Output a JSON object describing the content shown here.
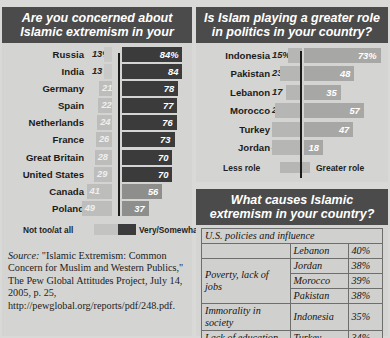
{
  "panel1": {
    "title": "Are you concerned about Islamic extremism in your",
    "legend": {
      "left": "Not too/at all",
      "right": "Very/Somewhat"
    },
    "source_label": "Source:",
    "source_text": "  \"Islamic Extremism: Common Concern for Muslim and Western Publics,\" The Pew Global Attitudes Project, July 14, 2005, p. 25, http://pewglobal.org/reports/pdf/248.pdf."
  },
  "panel2": {
    "title": "Is Islam playing a greater role in politics in your country?",
    "legend": {
      "left": "Less role",
      "right": "Greater role"
    }
  },
  "panel3": {
    "title": "What causes Islamic extremism in your country?",
    "rows": [
      {
        "cause": "U.S. policies and influence",
        "country": "Lebanon",
        "pct": "40%"
      },
      {
        "cause": "Poverty, lack of jobs",
        "country": "Jordan",
        "pct": "38%"
      },
      {
        "cause": "",
        "country": "Morocco",
        "pct": "39%"
      },
      {
        "cause": "",
        "country": "Pakistan",
        "pct": "38%"
      },
      {
        "cause": "Immorality in society",
        "country": "Indonesia",
        "pct": "35%"
      },
      {
        "cause": "Lack of education",
        "country": "Turkey",
        "pct": "34%"
      }
    ]
  },
  "chart_data": [
    {
      "type": "bar",
      "title": "Are you concerned about Islamic extremism in your",
      "orientation": "horizontal-diverging",
      "categories": [
        "Russia",
        "India",
        "Germany",
        "Spain",
        "Netherlands",
        "France",
        "Great Britain",
        "United States",
        "Canada",
        "Poland"
      ],
      "series": [
        {
          "name": "Not too/at all",
          "values": [
            13,
            13,
            21,
            22,
            24,
            26,
            28,
            29,
            41,
            49
          ],
          "labels": [
            "13%",
            "13",
            "21",
            "22",
            "24",
            "26",
            "28",
            "29",
            "41",
            "49"
          ]
        },
        {
          "name": "Very/Somewhat",
          "values": [
            84,
            84,
            78,
            77,
            76,
            73,
            70,
            70,
            56,
            37
          ],
          "labels": [
            "84%",
            "84",
            "78",
            "77",
            "76",
            "73",
            "70",
            "70",
            "56",
            "37"
          ]
        }
      ],
      "xlabel": "",
      "ylabel": "",
      "grid": false,
      "legend_position": "bottom"
    },
    {
      "type": "bar",
      "title": "Is Islam playing a greater role in politics in your country?",
      "orientation": "horizontal-diverging",
      "categories": [
        "Indonesia",
        "Pakistan",
        "Lebanon",
        "Morocco",
        "Turkey",
        "Jordan"
      ],
      "series": [
        {
          "name": "Less role",
          "values": [
            15,
            23,
            17,
            28,
            32,
            43
          ],
          "labels": [
            "15%",
            "23",
            "17",
            "28",
            "32",
            "43"
          ]
        },
        {
          "name": "Greater role",
          "values": [
            73,
            48,
            35,
            57,
            47,
            18
          ],
          "labels": [
            "73%",
            "48",
            "35",
            "57",
            "47",
            "18"
          ]
        }
      ],
      "xlabel": "",
      "ylabel": "",
      "grid": false,
      "legend_position": "bottom"
    },
    {
      "type": "table",
      "title": "What causes Islamic extremism in your country?",
      "columns": [
        "Cause",
        "Country",
        "Percent"
      ],
      "rows": [
        [
          "U.S. policies and influence",
          "Lebanon",
          "40%"
        ],
        [
          "Poverty, lack of jobs",
          "Jordan",
          "38%"
        ],
        [
          "Poverty, lack of jobs",
          "Morocco",
          "39%"
        ],
        [
          "Poverty, lack of jobs",
          "Pakistan",
          "38%"
        ],
        [
          "Immorality in society",
          "Indonesia",
          "35%"
        ],
        [
          "Lack of education",
          "Turkey",
          "34%"
        ]
      ]
    }
  ]
}
